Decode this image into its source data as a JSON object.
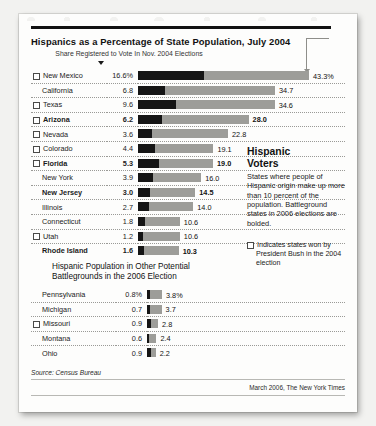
{
  "chart_data": {
    "type": "bar",
    "title": "Hispanics as a Percentage of State Population, July 2004",
    "subtitle": "Share Registered to Vote In Nov. 2004 Elections",
    "xlabel": "",
    "ylabel": "",
    "xlim": [
      0,
      45
    ],
    "grid": false,
    "legend": "",
    "series": [
      {
        "name": "Share Registered to Vote In Nov. 2004 Elections",
        "color": "#151515"
      },
      {
        "name": "Hispanics as a Percentage of State Population, July 2004",
        "color": "#9d9d99"
      }
    ],
    "categories": [
      "New Mexico",
      "California",
      "Texas",
      "Arizona",
      "Nevada",
      "Colorado",
      "Florida",
      "New York",
      "New Jersey",
      "Illinois",
      "Connecticut",
      "Utah",
      "Rhode Island"
    ],
    "registered": [
      16.6,
      6.8,
      9.6,
      6.2,
      3.6,
      4.4,
      5.3,
      3.9,
      3.0,
      2.7,
      1.8,
      1.2,
      1.6
    ],
    "population": [
      43.3,
      34.7,
      34.6,
      28.0,
      22.8,
      19.1,
      19.0,
      16.0,
      14.5,
      14.0,
      10.6,
      10.6,
      10.3
    ],
    "categories_2": [
      "Pennsylvania",
      "Michigan",
      "Missouri",
      "Montana",
      "Ohio"
    ],
    "registered_2": [
      0.8,
      0.7,
      0.9,
      0.6,
      0.9
    ],
    "population_2": [
      3.8,
      3.7,
      2.8,
      2.4,
      2.2
    ]
  },
  "header": {
    "title": "Hispanics as a Percentage of State Population, July 2004",
    "subtitle": "Share Registered to Vote In Nov. 2004 Elections"
  },
  "table1": {
    "rows": [
      {
        "state": "New Mexico",
        "bush": true,
        "reg": "16.6%",
        "pop": "43.3%",
        "bold": false
      },
      {
        "state": "California",
        "bush": false,
        "reg": "6.8",
        "pop": "34.7",
        "bold": false
      },
      {
        "state": "Texas",
        "bush": true,
        "reg": "9.6",
        "pop": "34.6",
        "bold": false
      },
      {
        "state": "Arizona",
        "bush": true,
        "reg": "6.2",
        "pop": "28.0",
        "bold": true
      },
      {
        "state": "Nevada",
        "bush": true,
        "reg": "3.6",
        "pop": "22.8",
        "bold": false
      },
      {
        "state": "Colorado",
        "bush": true,
        "reg": "4.4",
        "pop": "19.1",
        "bold": false
      },
      {
        "state": "Florida",
        "bush": true,
        "reg": "5.3",
        "pop": "19.0",
        "bold": true
      },
      {
        "state": "New York",
        "bush": false,
        "reg": "3.9",
        "pop": "16.0",
        "bold": false
      },
      {
        "state": "New Jersey",
        "bush": false,
        "reg": "3.0",
        "pop": "14.5",
        "bold": true
      },
      {
        "state": "Illinois",
        "bush": false,
        "reg": "2.7",
        "pop": "14.0",
        "bold": false
      },
      {
        "state": "Connecticut",
        "bush": false,
        "reg": "1.8",
        "pop": "10.6",
        "bold": false
      },
      {
        "state": "Utah",
        "bush": true,
        "reg": "1.2",
        "pop": "10.6",
        "bold": false
      },
      {
        "state": "Rhode Island",
        "bush": false,
        "reg": "1.6",
        "pop": "10.3",
        "bold": true
      }
    ]
  },
  "section2": {
    "title_line1": "Hispanic Population in Other Potential",
    "title_line2": "Battlegrounds in the 2006 Election",
    "rows": [
      {
        "state": "Pennsylvania",
        "bush": false,
        "reg": "0.8%",
        "pop": "3.8%"
      },
      {
        "state": "Michigan",
        "bush": false,
        "reg": "0.7",
        "pop": "3.7"
      },
      {
        "state": "Missouri",
        "bush": true,
        "reg": "0.9",
        "pop": "2.8"
      },
      {
        "state": "Montana",
        "bush": false,
        "reg": "0.6",
        "pop": "2.4"
      },
      {
        "state": "Ohio",
        "bush": false,
        "reg": "0.9",
        "pop": "2.2"
      }
    ]
  },
  "sidebar": {
    "heading_line1": "Hispanic",
    "heading_line2": "Voters",
    "body": "States where people of Hispanic origin make up more than 10 percent of the population. Battleground states in 2006 elections are bolded.",
    "legend_note": "Indicates states won by President Bush in the 2004 election"
  },
  "footer": {
    "source": "Source: Census Bureau",
    "credit": "March 2006, The New York Times"
  }
}
